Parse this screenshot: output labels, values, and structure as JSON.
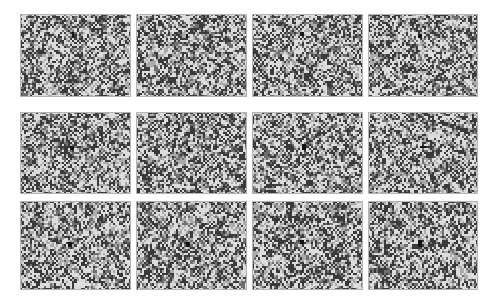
{
  "figure": {
    "type": "panel-grid",
    "title": "",
    "width": 494,
    "height": 307,
    "background_color": "#ffffff",
    "rows": 3,
    "columns": 4,
    "panel_count": 12,
    "panel_border_color": "#b4b4b4",
    "panel_background_color": "#cfcfcf"
  },
  "chart_data": {
    "type": "heatmap",
    "title": "",
    "subtitle": "",
    "xlabel": "",
    "ylabel": "",
    "grid": false,
    "legend_position": "none",
    "panel_grid": {
      "rows": 3,
      "cols": 4
    },
    "cell_grid": {
      "rows": 41,
      "cols": 55
    },
    "cell_size_px": 2,
    "value_levels": [
      0,
      1,
      2,
      3
    ],
    "level_colors": [
      "#dcdcdc",
      "#ababab",
      "#6e6e6e",
      "#3a3a3a"
    ],
    "marker_color": "#141414",
    "level_probabilities": [
      0.34,
      0.2,
      0.16,
      0.3
    ],
    "panels": [
      {
        "id": "panel-1",
        "label": "",
        "row": 0,
        "col": 0,
        "seed": 10117,
        "x": 20,
        "y": 14,
        "w": 111,
        "h": 83,
        "marker": {
          "col": 26,
          "row": 9,
          "w": 1,
          "h": 3
        }
      },
      {
        "id": "panel-2",
        "label": "",
        "row": 0,
        "col": 1,
        "seed": 20231,
        "x": 136,
        "y": 14,
        "w": 111,
        "h": 83,
        "marker": {
          "col": 25,
          "row": 10,
          "w": 1,
          "h": 2
        }
      },
      {
        "id": "panel-3",
        "label": "",
        "row": 0,
        "col": 2,
        "seed": 30347,
        "x": 252,
        "y": 14,
        "w": 111,
        "h": 83,
        "marker": {
          "col": 24,
          "row": 9,
          "w": 2,
          "h": 2
        }
      },
      {
        "id": "panel-4",
        "label": "",
        "row": 0,
        "col": 3,
        "seed": 40459,
        "x": 368,
        "y": 14,
        "w": 110,
        "h": 83,
        "marker": {
          "col": 25,
          "row": 10,
          "w": 2,
          "h": 2
        }
      },
      {
        "id": "panel-5",
        "label": "",
        "row": 1,
        "col": 0,
        "seed": 50563,
        "x": 20,
        "y": 112,
        "w": 111,
        "h": 82,
        "marker": {
          "col": 25,
          "row": 17,
          "w": 2,
          "h": 2
        }
      },
      {
        "id": "panel-6",
        "label": "",
        "row": 1,
        "col": 1,
        "seed": 60679,
        "x": 136,
        "y": 112,
        "w": 111,
        "h": 82,
        "marker": {
          "col": 26,
          "row": 17,
          "w": 1,
          "h": 3
        }
      },
      {
        "id": "panel-7",
        "label": "",
        "row": 1,
        "col": 2,
        "seed": 70783,
        "x": 252,
        "y": 112,
        "w": 111,
        "h": 82,
        "marker": {
          "col": 25,
          "row": 16,
          "w": 2,
          "h": 3
        }
      },
      {
        "id": "panel-8",
        "label": "",
        "row": 1,
        "col": 3,
        "seed": 80897,
        "x": 368,
        "y": 112,
        "w": 110,
        "h": 82,
        "marker": {
          "col": 26,
          "row": 17,
          "w": 3,
          "h": 1
        }
      },
      {
        "id": "panel-9",
        "label": "",
        "row": 2,
        "col": 0,
        "seed": 90911,
        "x": 20,
        "y": 201,
        "w": 111,
        "h": 89,
        "marker": {
          "col": 24,
          "row": 19,
          "w": 2,
          "h": 2
        }
      },
      {
        "id": "panel-10",
        "label": "",
        "row": 2,
        "col": 1,
        "seed": 101027,
        "x": 136,
        "y": 201,
        "w": 111,
        "h": 89,
        "marker": {
          "col": 25,
          "row": 19,
          "w": 2,
          "h": 2
        }
      },
      {
        "id": "panel-11",
        "label": "",
        "row": 2,
        "col": 2,
        "seed": 111133,
        "x": 252,
        "y": 201,
        "w": 111,
        "h": 89,
        "marker": {
          "col": 24,
          "row": 18,
          "w": 2,
          "h": 2
        }
      },
      {
        "id": "panel-12",
        "label": "",
        "row": 2,
        "col": 3,
        "seed": 121249,
        "x": 368,
        "y": 201,
        "w": 110,
        "h": 89,
        "marker": {
          "col": 25,
          "row": 18,
          "w": 2,
          "h": 3
        }
      }
    ]
  }
}
